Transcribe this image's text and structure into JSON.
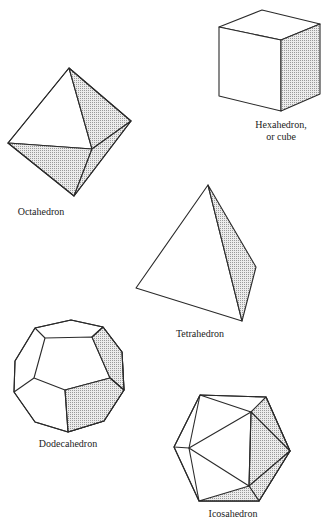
{
  "figure": {
    "shade_color": "#c8c8c8",
    "solids": [
      {
        "id": "octahedron",
        "label": "Octahedron",
        "faces": 8
      },
      {
        "id": "hexahedron",
        "label_line1": "Hexahedron,",
        "label_line2": "or cube",
        "faces": 6
      },
      {
        "id": "tetrahedron",
        "label": "Tetrahedron",
        "faces": 4
      },
      {
        "id": "dodecahedron",
        "label": "Dodecahedron",
        "faces": 12
      },
      {
        "id": "icosahedron",
        "label": "Icosahedron",
        "faces": 20
      }
    ]
  }
}
